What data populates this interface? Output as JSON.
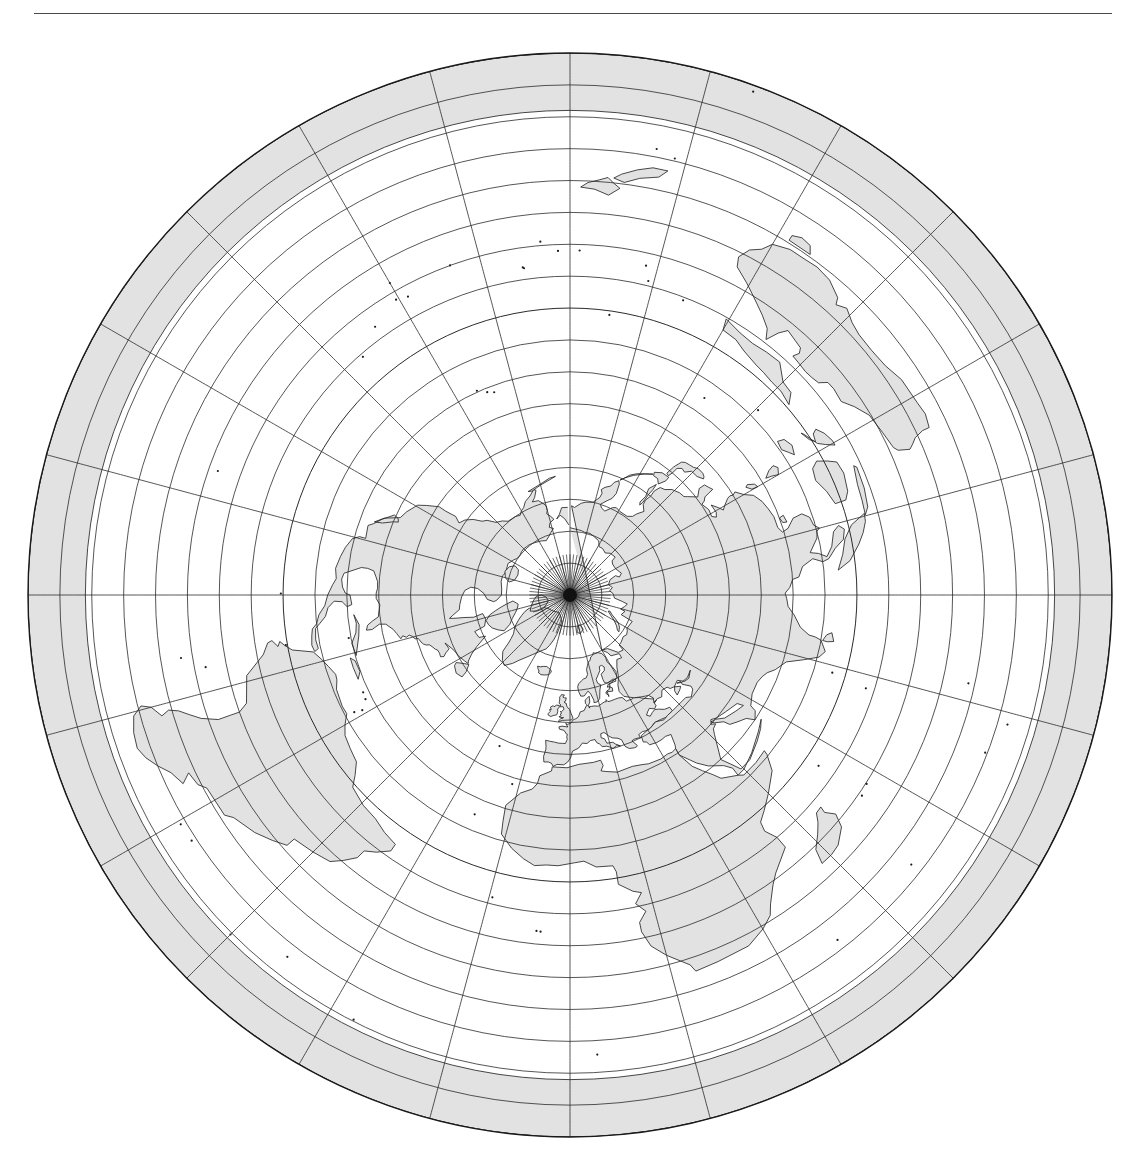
{
  "page": {
    "width": 1146,
    "height": 1176,
    "background": "#ffffff",
    "ink": "#1a1a1a"
  },
  "header": {
    "running_head": "      ",
    "running_head_note": "clipped line of text at page top edge, illegible",
    "rule_color": "#4a4a4a"
  },
  "figure": {
    "projection": "azimuthal equidistant",
    "center_label": "North Pole",
    "center_lat": 90,
    "center_lon": 0,
    "caption": ""
  },
  "chart_data": {
    "type": "map",
    "projection": "azimuthal equidistant",
    "center": {
      "lat": 90,
      "lon": 0
    },
    "rotation_deg": 0,
    "edge_latitude": -80,
    "outer_radius_px": 542,
    "center_px": {
      "x": 570,
      "y": 577
    },
    "graticule": {
      "parallel_interval_deg": 10,
      "meridian_interval_deg": 15,
      "parallels": [
        80,
        70,
        60,
        50,
        40,
        30,
        20,
        10,
        0,
        -10,
        -20,
        -30,
        -40,
        -50,
        -60,
        -70,
        -80
      ],
      "meridians": [
        0,
        15,
        30,
        45,
        60,
        75,
        90,
        105,
        120,
        135,
        150,
        165,
        180,
        195,
        210,
        225,
        240,
        255,
        270,
        285,
        300,
        315,
        330,
        345
      ],
      "equator_emphasis": true,
      "grid_color": "#2b2b2b",
      "grid_width_px": 0.8,
      "pole_converge_fan_meridian_interval_deg": 5
    },
    "land": {
      "fill": "#e2e2e2",
      "stroke": "#1a1a1a",
      "stroke_width_px": 0.8,
      "regions": [
        "North America",
        "Greenland",
        "South America",
        "Europe",
        "Africa",
        "Asia",
        "Australia",
        "New Zealand",
        "Antarctica (outer rim band)",
        "Indonesia",
        "Japan",
        "Philippines",
        "Madagascar",
        "British Isles",
        "Iceland",
        "Caribbean islands",
        "Svalbard",
        "Novaya Zemlya",
        "Canadian Arctic Archipelago"
      ]
    },
    "rim_band": {
      "description": "shaded annulus at map edge representing Antarctica",
      "fill": "#e2e2e2",
      "inner_latitude": -62,
      "outer_latitude": -80
    },
    "ylim": [
      -80,
      90
    ],
    "grid": true,
    "legend": "none"
  }
}
